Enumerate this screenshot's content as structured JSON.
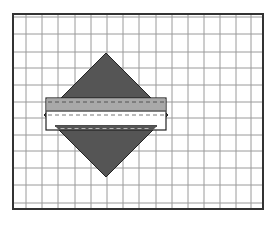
{
  "figure": {
    "background": "#ffffff",
    "grid": {
      "frame": {
        "x": 13,
        "y": 14,
        "width": 250,
        "height": 195,
        "stroke": "#333333",
        "stroke_width": 2
      },
      "vertical_lines_x": [
        26,
        42,
        58,
        75,
        91,
        107,
        123,
        139,
        156,
        172,
        188,
        204,
        220,
        236,
        251
      ],
      "horizontal_lines_y": [
        17,
        34,
        52,
        68,
        85,
        102,
        118,
        135,
        151,
        168,
        185,
        203
      ],
      "line_color": "#9a9a9a"
    },
    "diamond": {
      "center_x": 106,
      "center_y": 115,
      "top": [
        106,
        53
      ],
      "right": [
        168,
        115
      ],
      "bottom": [
        106,
        177
      ],
      "left": [
        44,
        115
      ],
      "fill": "#555555",
      "stroke": "#222222"
    },
    "band": {
      "outer": {
        "x": 46,
        "y": 98,
        "width": 120,
        "height": 32,
        "stroke": "#222222"
      },
      "gray_section": {
        "y": 98,
        "height": 13,
        "fill": "#a9a9a9"
      },
      "white_section": {
        "y": 111,
        "height": 15,
        "fill": "#ffffff"
      },
      "bottom_rule_y": 126,
      "dashed_lines": [
        {
          "y": 102,
          "color": "#555555"
        },
        {
          "y": 115,
          "color": "#777777"
        },
        {
          "y": 128.5,
          "color": "#bbbbbb"
        }
      ]
    }
  }
}
